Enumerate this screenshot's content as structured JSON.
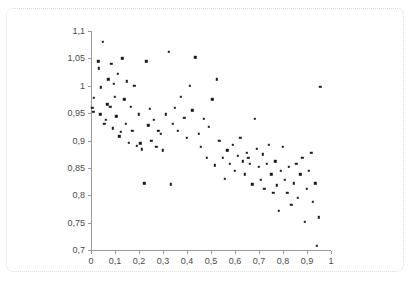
{
  "chart_data": {
    "type": "scatter",
    "title": "",
    "xlabel": "",
    "ylabel": "",
    "xlim": [
      0,
      1
    ],
    "ylim": [
      0.7,
      1.1
    ],
    "grid": false,
    "legend": null,
    "decimal_separator": ",",
    "xticks": [
      0,
      0.1,
      0.2,
      0.3,
      0.4,
      0.5,
      0.6,
      0.7,
      0.8,
      0.9,
      1
    ],
    "xticklabels": [
      "0",
      "0,1",
      "0,2",
      "0,3",
      "0,4",
      "0,5",
      "0,6",
      "0,7",
      "0,8",
      "0,9",
      "1"
    ],
    "yticks": [
      0.7,
      0.75,
      0.8,
      0.85,
      0.9,
      0.95,
      1,
      1.05,
      1.1
    ],
    "yticklabels": [
      "0,7",
      "0,75",
      "0,8",
      "0,85",
      "0,9",
      "0,95",
      "1",
      "1,05",
      "1,1"
    ],
    "marker": "square",
    "marker_color": "#1a1a1a",
    "marker_size": 2.4,
    "n_points": 110,
    "points": [
      [
        0.005,
        0.96
      ],
      [
        0.01,
        0.952
      ],
      [
        0.012,
        0.978
      ],
      [
        0.03,
        1.045
      ],
      [
        0.033,
        1.032
      ],
      [
        0.038,
        0.948
      ],
      [
        0.04,
        0.997
      ],
      [
        0.05,
        1.08
      ],
      [
        0.055,
        0.93
      ],
      [
        0.062,
        0.938
      ],
      [
        0.068,
        0.966
      ],
      [
        0.072,
        1.012
      ],
      [
        0.08,
        0.962
      ],
      [
        0.085,
        1.04
      ],
      [
        0.09,
        0.922
      ],
      [
        0.095,
        1.004
      ],
      [
        0.1,
        0.98
      ],
      [
        0.105,
        0.944
      ],
      [
        0.112,
        1.022
      ],
      [
        0.118,
        0.908
      ],
      [
        0.125,
        0.916
      ],
      [
        0.13,
        1.05
      ],
      [
        0.138,
        0.975
      ],
      [
        0.145,
        0.93
      ],
      [
        0.15,
        1.008
      ],
      [
        0.158,
        0.896
      ],
      [
        0.165,
        0.962
      ],
      [
        0.172,
        0.918
      ],
      [
        0.18,
        1.0
      ],
      [
        0.19,
        0.89
      ],
      [
        0.2,
        0.948
      ],
      [
        0.205,
        0.895
      ],
      [
        0.212,
        0.884
      ],
      [
        0.222,
        0.822
      ],
      [
        0.23,
        1.045
      ],
      [
        0.238,
        0.928
      ],
      [
        0.245,
        0.958
      ],
      [
        0.252,
        0.9
      ],
      [
        0.262,
        0.938
      ],
      [
        0.272,
        0.888
      ],
      [
        0.28,
        0.918
      ],
      [
        0.292,
        0.912
      ],
      [
        0.3,
        0.882
      ],
      [
        0.312,
        0.948
      ],
      [
        0.325,
        1.062
      ],
      [
        0.332,
        0.82
      ],
      [
        0.34,
        0.93
      ],
      [
        0.35,
        0.96
      ],
      [
        0.362,
        0.918
      ],
      [
        0.375,
        0.98
      ],
      [
        0.388,
        0.942
      ],
      [
        0.4,
        0.905
      ],
      [
        0.412,
        1.0
      ],
      [
        0.422,
        0.955
      ],
      [
        0.435,
        1.052
      ],
      [
        0.448,
        0.912
      ],
      [
        0.458,
        0.888
      ],
      [
        0.47,
        0.94
      ],
      [
        0.482,
        0.868
      ],
      [
        0.492,
        0.925
      ],
      [
        0.505,
        0.975
      ],
      [
        0.515,
        0.855
      ],
      [
        0.525,
        1.012
      ],
      [
        0.535,
        0.9
      ],
      [
        0.548,
        0.868
      ],
      [
        0.558,
        0.83
      ],
      [
        0.568,
        0.882
      ],
      [
        0.578,
        0.858
      ],
      [
        0.59,
        0.892
      ],
      [
        0.6,
        0.845
      ],
      [
        0.612,
        0.872
      ],
      [
        0.622,
        0.905
      ],
      [
        0.632,
        0.862
      ],
      [
        0.64,
        0.838
      ],
      [
        0.648,
        0.878
      ],
      [
        0.655,
        0.868
      ],
      [
        0.662,
        0.858
      ],
      [
        0.672,
        0.82
      ],
      [
        0.682,
        0.94
      ],
      [
        0.692,
        0.885
      ],
      [
        0.7,
        0.852
      ],
      [
        0.708,
        0.828
      ],
      [
        0.715,
        0.875
      ],
      [
        0.722,
        0.812
      ],
      [
        0.732,
        0.858
      ],
      [
        0.742,
        0.892
      ],
      [
        0.752,
        0.838
      ],
      [
        0.76,
        0.805
      ],
      [
        0.768,
        0.862
      ],
      [
        0.775,
        0.818
      ],
      [
        0.782,
        0.772
      ],
      [
        0.792,
        0.845
      ],
      [
        0.8,
        0.888
      ],
      [
        0.808,
        0.828
      ],
      [
        0.818,
        0.805
      ],
      [
        0.825,
        0.852
      ],
      [
        0.835,
        0.782
      ],
      [
        0.845,
        0.822
      ],
      [
        0.855,
        0.858
      ],
      [
        0.862,
        0.795
      ],
      [
        0.872,
        0.838
      ],
      [
        0.88,
        0.868
      ],
      [
        0.89,
        0.752
      ],
      [
        0.9,
        0.812
      ],
      [
        0.908,
        0.845
      ],
      [
        0.918,
        0.878
      ],
      [
        0.925,
        0.788
      ],
      [
        0.935,
        0.822
      ],
      [
        0.942,
        0.708
      ],
      [
        0.948,
        0.76
      ],
      [
        0.955,
        0.998
      ]
    ]
  },
  "axes": {
    "y_axis_name": "y-axis",
    "x_axis_name": "x-axis"
  }
}
